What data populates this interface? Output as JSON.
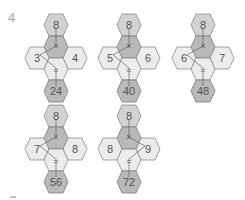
{
  "header": {
    "question_number": "4"
  },
  "puzzles": [
    {
      "top": "8",
      "left": "3",
      "right": "4",
      "bottom": "24",
      "multiply_symbol": "×",
      "equals_symbol": "="
    },
    {
      "top": "8",
      "left": "5",
      "right": "6",
      "bottom": "40",
      "multiply_symbol": "×",
      "equals_symbol": "="
    },
    {
      "top": "8",
      "left": "6",
      "right": "7",
      "bottom": "48",
      "multiply_symbol": "×",
      "equals_symbol": "="
    },
    {
      "top": "8",
      "left": "7",
      "right": "8",
      "bottom": "56",
      "multiply_symbol": "×",
      "equals_symbol": "="
    },
    {
      "top": "8",
      "left": "8",
      "right": "9",
      "bottom": "72",
      "multiply_symbol": "×",
      "equals_symbol": "="
    }
  ],
  "colors": {
    "hex_light": "#ececec",
    "hex_mid": "#d2d2d2",
    "hex_dark": "#b9b9b9",
    "stroke": "#8a8a8a",
    "text": "#555555"
  }
}
